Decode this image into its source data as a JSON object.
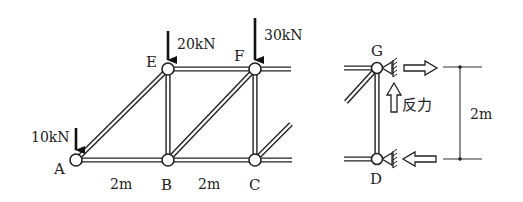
{
  "figure": {
    "left_truss": {
      "joints": [
        {
          "id": "A",
          "label": "A",
          "x": 76,
          "y": 160
        },
        {
          "id": "B",
          "label": "B",
          "x": 168,
          "y": 160
        },
        {
          "id": "C",
          "label": "C",
          "x": 255,
          "y": 160
        },
        {
          "id": "E",
          "label": "E",
          "x": 168,
          "y": 69
        },
        {
          "id": "F",
          "label": "F",
          "x": 255,
          "y": 69
        }
      ],
      "loads": [
        {
          "at": "A",
          "label": "10kN"
        },
        {
          "at": "E",
          "label": "20kN"
        },
        {
          "at": "F",
          "label": "30kN"
        }
      ],
      "dimensions": [
        {
          "between": "A-B",
          "label": "2m"
        },
        {
          "between": "B-C",
          "label": "2m"
        }
      ]
    },
    "right_detail": {
      "joints": [
        {
          "id": "G",
          "label": "G"
        },
        {
          "id": "D",
          "label": "D"
        }
      ],
      "reaction_label": "反力",
      "height_dimension": "2m"
    }
  }
}
